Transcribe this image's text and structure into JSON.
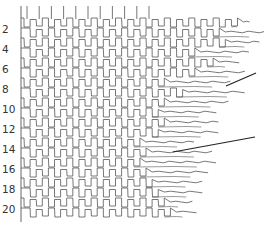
{
  "diagram": {
    "type": "staggered-row-pattern",
    "stroke_color": "#555555",
    "leader_color": "#222222",
    "axis_x": 21,
    "axis_top": 6,
    "axis_bottom": 222,
    "row_spacing": 9.9,
    "first_row_y": 19,
    "cell_width": 12.2,
    "cell_height": 9,
    "row_labels": [
      {
        "text": "2",
        "y": 29
      },
      {
        "text": "4",
        "y": 49
      },
      {
        "text": "6",
        "y": 69
      },
      {
        "text": "8",
        "y": 89
      },
      {
        "text": "10",
        "y": 109
      },
      {
        "text": "12",
        "y": 129
      },
      {
        "text": "14",
        "y": 149
      },
      {
        "text": "16",
        "y": 169
      },
      {
        "text": "18",
        "y": 189
      },
      {
        "text": "20",
        "y": 209
      }
    ],
    "rows": [
      {
        "y": 19,
        "cells": 18,
        "tail": 6
      },
      {
        "y": 29,
        "cells": 16,
        "tail": 40
      },
      {
        "y": 39,
        "cells": 17,
        "tail": 28
      },
      {
        "y": 49,
        "cells": 14,
        "tail": 48
      },
      {
        "y": 59,
        "cells": 16,
        "tail": 20
      },
      {
        "y": 69,
        "cells": 14,
        "tail": 44
      },
      {
        "y": 79,
        "cells": 12,
        "tail": 60
      },
      {
        "y": 89,
        "cells": 13,
        "tail": 56
      },
      {
        "y": 99,
        "cells": 12,
        "tail": 58
      },
      {
        "y": 109,
        "cells": 11,
        "tail": 52
      },
      {
        "y": 119,
        "cells": 12,
        "tail": 48
      },
      {
        "y": 129,
        "cells": 11,
        "tail": 54
      },
      {
        "y": 139,
        "cells": 10,
        "tail": 48
      },
      {
        "y": 149,
        "cells": 10,
        "tail": 60
      },
      {
        "y": 159,
        "cells": 10,
        "tail": 70
      },
      {
        "y": 169,
        "cells": 10,
        "tail": 56
      },
      {
        "y": 179,
        "cells": 11,
        "tail": 44
      },
      {
        "y": 189,
        "cells": 11,
        "tail": 38
      },
      {
        "y": 199,
        "cells": 12,
        "tail": 22
      },
      {
        "y": 209,
        "cells": 12,
        "tail": 20
      }
    ],
    "top_ticks": {
      "count": 11,
      "y_top": 6,
      "y_bottom": 19
    },
    "leader_lines": [
      {
        "x1": 226,
        "y1": 86,
        "x2": 256,
        "y2": 73
      },
      {
        "x1": 173,
        "y1": 152,
        "x2": 255,
        "y2": 137
      }
    ]
  }
}
